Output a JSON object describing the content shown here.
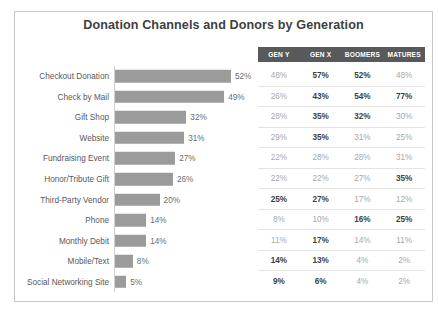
{
  "title": "Donation Channels and Donors by Generation",
  "chart_data": {
    "type": "bar",
    "title": "Donation Channels and Donors by Generation",
    "xlabel": "",
    "ylabel": "",
    "orientation": "horizontal",
    "grid": false,
    "legend": "none",
    "xlim": [
      0,
      60
    ],
    "categories": [
      "Checkout Donation",
      "Check by Mail",
      "Gift Shop",
      "Website",
      "Fundraising Event",
      "Honor/Tribute Gift",
      "Third-Party Vendor",
      "Phone",
      "Monthly Debit",
      "Mobile/Text",
      "Social Networking Site"
    ],
    "values": [
      52,
      49,
      32,
      31,
      27,
      26,
      20,
      14,
      14,
      8,
      5
    ],
    "value_labels": [
      "52%",
      "49%",
      "32%",
      "31%",
      "27%",
      "26%",
      "20%",
      "14%",
      "14%",
      "8%",
      "5%"
    ],
    "table": {
      "columns": [
        "GEN Y",
        "GEN X",
        "BOOMERS",
        "MATURES"
      ],
      "rows": [
        {
          "cells": [
            "48%",
            "57%",
            "52%",
            "48%"
          ],
          "bold": [
            false,
            true,
            true,
            false
          ]
        },
        {
          "cells": [
            "26%",
            "43%",
            "54%",
            "77%"
          ],
          "bold": [
            false,
            true,
            true,
            true
          ]
        },
        {
          "cells": [
            "28%",
            "35%",
            "32%",
            "30%"
          ],
          "bold": [
            false,
            true,
            true,
            false
          ]
        },
        {
          "cells": [
            "29%",
            "35%",
            "31%",
            "25%"
          ],
          "bold": [
            false,
            true,
            false,
            false
          ]
        },
        {
          "cells": [
            "22%",
            "28%",
            "28%",
            "31%"
          ],
          "bold": [
            false,
            false,
            false,
            false
          ]
        },
        {
          "cells": [
            "22%",
            "22%",
            "27%",
            "35%"
          ],
          "bold": [
            false,
            false,
            false,
            true
          ]
        },
        {
          "cells": [
            "25%",
            "27%",
            "17%",
            "12%"
          ],
          "bold": [
            true,
            true,
            false,
            false
          ]
        },
        {
          "cells": [
            "8%",
            "10%",
            "16%",
            "25%"
          ],
          "bold": [
            false,
            false,
            true,
            true
          ]
        },
        {
          "cells": [
            "11%",
            "17%",
            "14%",
            "11%"
          ],
          "bold": [
            false,
            true,
            false,
            false
          ]
        },
        {
          "cells": [
            "14%",
            "13%",
            "4%",
            "2%"
          ],
          "bold": [
            true,
            true,
            false,
            false
          ]
        },
        {
          "cells": [
            "9%",
            "6%",
            "4%",
            "2%"
          ],
          "bold": [
            true,
            true,
            false,
            false
          ]
        }
      ]
    }
  },
  "colors": {
    "bar": "#9b9b9b",
    "header_background": "#58595b",
    "frame_border": "#c9c9c9",
    "title_text": "#3f3f3f",
    "muted_text": "#a8a8a8"
  }
}
